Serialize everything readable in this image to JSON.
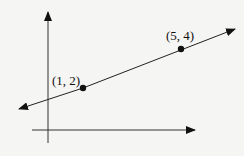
{
  "diagram": {
    "type": "coordinate line through two points",
    "points": [
      {
        "label": "(1, 2)",
        "x": 1,
        "y": 2
      },
      {
        "label": "(5, 4)",
        "x": 5,
        "y": 4
      }
    ],
    "colors": {
      "ink": "#111111",
      "background": "#f5f5f3"
    }
  }
}
